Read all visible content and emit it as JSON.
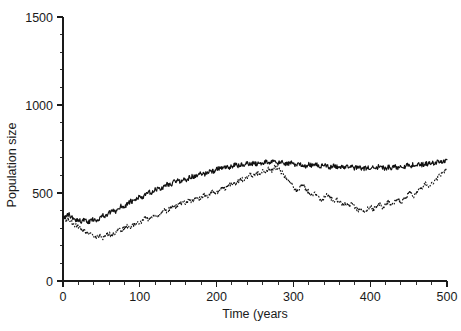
{
  "chart_data": {
    "type": "line",
    "title": "",
    "xlabel": "Time (years",
    "ylabel": "Population size",
    "xlim": [
      0,
      500
    ],
    "ylim": [
      0,
      1500
    ],
    "grid": false,
    "legend": "none",
    "x_major_ticks": [
      0,
      100,
      200,
      300,
      400,
      500
    ],
    "x_tick_labels": [
      "0",
      "100",
      "200",
      "300",
      "400",
      "500"
    ],
    "x_minor_interval": 20,
    "y_major_ticks": [
      0,
      500,
      1000,
      1500
    ],
    "y_tick_labels": [
      "0",
      "500",
      "1000",
      "1500"
    ],
    "y_minor_interval": 100,
    "x": [
      0,
      4,
      8,
      12,
      16,
      20,
      24,
      28,
      32,
      36,
      40,
      44,
      48,
      52,
      56,
      60,
      64,
      68,
      72,
      76,
      80,
      84,
      88,
      92,
      96,
      100,
      104,
      108,
      112,
      116,
      120,
      124,
      128,
      132,
      136,
      140,
      144,
      148,
      152,
      156,
      160,
      164,
      168,
      172,
      176,
      180,
      184,
      188,
      192,
      196,
      200,
      204,
      208,
      212,
      216,
      220,
      224,
      228,
      232,
      236,
      240,
      244,
      248,
      252,
      256,
      260,
      264,
      268,
      272,
      276,
      280,
      284,
      288,
      292,
      296,
      300,
      304,
      308,
      312,
      316,
      320,
      324,
      328,
      332,
      336,
      340,
      344,
      348,
      352,
      356,
      360,
      364,
      368,
      372,
      376,
      380,
      384,
      388,
      392,
      396,
      400,
      404,
      408,
      412,
      416,
      420,
      424,
      428,
      432,
      436,
      440,
      444,
      448,
      452,
      456,
      460,
      464,
      468,
      472,
      476,
      480,
      484,
      488,
      492,
      496,
      500
    ],
    "series": [
      {
        "name": "solid-series",
        "style": "solid",
        "values": [
          370,
          362,
          380,
          358,
          345,
          352,
          338,
          348,
          330,
          342,
          352,
          345,
          360,
          372,
          368,
          385,
          398,
          392,
          412,
          428,
          420,
          440,
          452,
          448,
          468,
          480,
          472,
          492,
          505,
          498,
          518,
          528,
          522,
          540,
          552,
          546,
          562,
          570,
          566,
          578,
          572,
          585,
          596,
          590,
          602,
          612,
          606,
          618,
          628,
          622,
          634,
          642,
          636,
          648,
          640,
          652,
          660,
          654,
          662,
          656,
          668,
          662,
          670,
          664,
          674,
          668,
          678,
          672,
          680,
          674,
          668,
          676,
          670,
          662,
          672,
          666,
          658,
          668,
          660,
          652,
          662,
          655,
          664,
          658,
          650,
          660,
          654,
          646,
          656,
          650,
          642,
          652,
          645,
          655,
          648,
          640,
          650,
          644,
          636,
          646,
          640,
          650,
          643,
          652,
          646,
          638,
          648,
          642,
          652,
          645,
          655,
          648,
          658,
          652,
          662,
          656,
          666,
          660,
          670,
          664,
          674,
          668,
          678,
          672,
          682,
          690
        ]
      },
      {
        "name": "dotted-series",
        "style": "dotted",
        "values": [
          360,
          345,
          352,
          330,
          318,
          308,
          295,
          285,
          272,
          262,
          252,
          248,
          258,
          246,
          258,
          268,
          262,
          278,
          290,
          284,
          300,
          312,
          306,
          322,
          334,
          328,
          345,
          358,
          350,
          368,
          380,
          372,
          392,
          404,
          396,
          416,
          428,
          420,
          440,
          450,
          442,
          462,
          452,
          468,
          458,
          475,
          488,
          478,
          498,
          508,
          500,
          520,
          532,
          524,
          544,
          556,
          548,
          568,
          580,
          572,
          592,
          604,
          596,
          616,
          608,
          628,
          620,
          638,
          630,
          648,
          640,
          620,
          598,
          576,
          554,
          532,
          510,
          530,
          548,
          528,
          506,
          486,
          500,
          478,
          458,
          478,
          496,
          474,
          452,
          470,
          448,
          428,
          446,
          424,
          440,
          420,
          400,
          412,
          392,
          408,
          424,
          404,
          420,
          438,
          418,
          436,
          452,
          432,
          450,
          468,
          448,
          466,
          484,
          502,
          482,
          500,
          518,
          536,
          554,
          534,
          552,
          570,
          588,
          606,
          624,
          645
        ]
      }
    ]
  },
  "geometry": {
    "plot_left": 63,
    "plot_right": 447,
    "plot_bottom": 281,
    "plot_top": 17
  }
}
